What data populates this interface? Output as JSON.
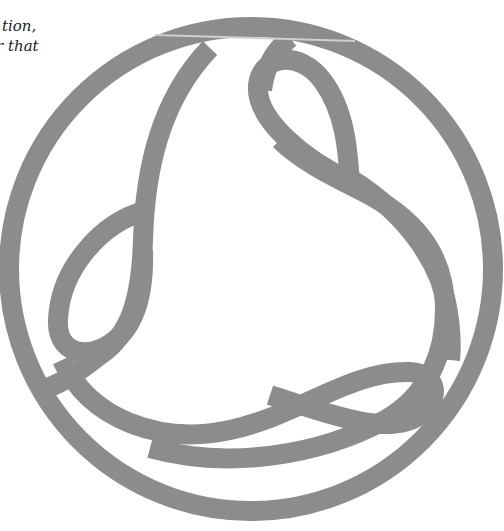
{
  "caption": {
    "line1": "tion,",
    "line2": "r that"
  },
  "figure": {
    "name": "circular-knot-emblem",
    "stroke_color": "#8c8c8c",
    "highlight_line_color": "#c8c8c8",
    "background": "#ffffff"
  }
}
